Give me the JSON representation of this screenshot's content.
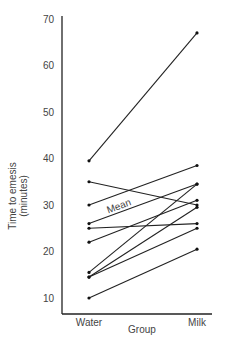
{
  "chart_data": {
    "type": "line",
    "title": "",
    "xlabel": "Group",
    "ylabel": "Time to emesis (minutes)",
    "ylabel_lines": [
      "Time to emesis",
      "(minutes)"
    ],
    "categories": [
      "Water",
      "Milk"
    ],
    "ylim": [
      7,
      70
    ],
    "yticks": [
      10,
      20,
      30,
      40,
      50,
      60,
      70
    ],
    "grid": false,
    "legend": null,
    "annotations": [
      {
        "text": "Mean",
        "series": "Mean"
      }
    ],
    "series": [
      {
        "name": "Subject 1",
        "values": [
          39.5,
          67
        ]
      },
      {
        "name": "Subject 2",
        "values": [
          35,
          30
        ]
      },
      {
        "name": "Subject 3",
        "values": [
          30,
          38.5
        ]
      },
      {
        "name": "Mean",
        "values": [
          26,
          34.5
        ]
      },
      {
        "name": "Subject 4",
        "values": [
          25,
          26
        ]
      },
      {
        "name": "Subject 5",
        "values": [
          22,
          31
        ]
      },
      {
        "name": "Subject 6",
        "values": [
          15.5,
          34.5
        ]
      },
      {
        "name": "Subject 7",
        "values": [
          14.5,
          29.5
        ]
      },
      {
        "name": "Subject 8",
        "values": [
          14.5,
          25
        ]
      },
      {
        "name": "Subject 9",
        "values": [
          10,
          20.5
        ]
      }
    ]
  }
}
